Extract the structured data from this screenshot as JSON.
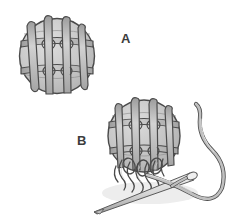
{
  "illustration": {
    "title": "Netted ball lacing diagram",
    "background_color": "#ffffff",
    "panels": [
      {
        "id": "A",
        "label": "A",
        "caption_position": {
          "x": 121,
          "y": 32
        },
        "subject": "netted-ball-finished",
        "description": "Round ball covered with a lattice of woven cords forming square mesh cells"
      },
      {
        "id": "B",
        "label": "B",
        "caption_position": {
          "x": 77,
          "y": 134
        },
        "subject": "netted-ball-with-needle-and-thread",
        "description": "Same netted ball with loose cord ends gathered at the bottom and a threaded sewing needle passing through"
      }
    ],
    "colors": {
      "outline": "#4a4a4a",
      "ball_fill": "#c9c9c9",
      "ball_fill_light": "#d8d8d8",
      "ball_fill_shadow": "#b0b0b0",
      "cord_fill": "#b9b9b9",
      "cord_highlight": "#d5d5d5",
      "cord_shadow": "#8e8e8e",
      "needle_fill": "#e2e2e2",
      "needle_outline": "#5a5a5a",
      "thread_fill": "#bcbcbc",
      "label_text": "#3c3c3c",
      "shadow": "#e6e6e6",
      "background": "#ffffff"
    },
    "geometry": {
      "ball_a": {
        "cx": 57,
        "cy": 56,
        "r": 38
      },
      "ball_b": {
        "cx": 144,
        "cy": 136,
        "r": 36
      },
      "needle_tip": {
        "x": 94,
        "y": 212
      },
      "needle_eye": {
        "x": 196,
        "y": 176
      },
      "thread_loop_extent": {
        "x": 226,
        "y": 205
      }
    }
  }
}
